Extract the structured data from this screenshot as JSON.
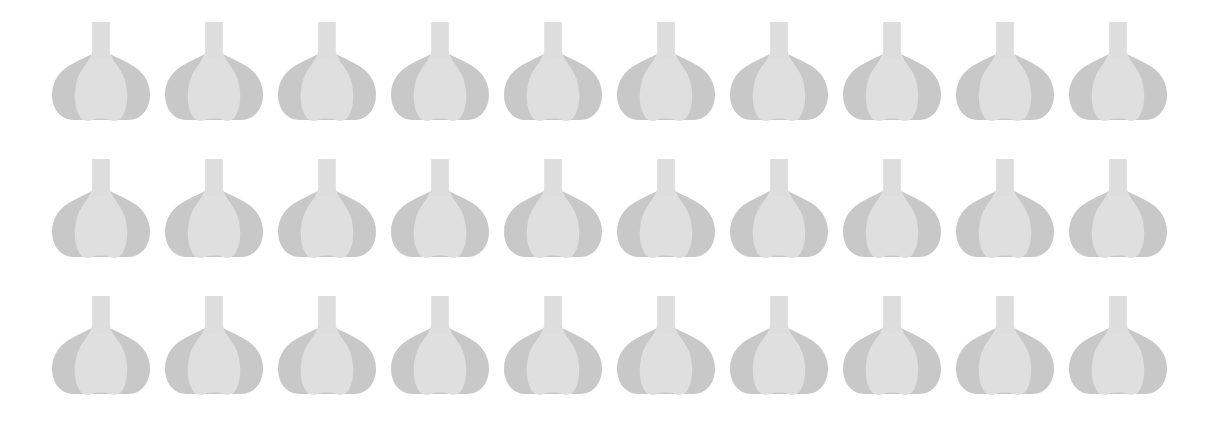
{
  "illustration": {
    "subject": "garlic bulbs",
    "icon": "garlic-icon",
    "rows": 3,
    "columns": 10,
    "count": 30,
    "colors": {
      "background": "#ffffff",
      "outer_lobes": "#c8c8c8",
      "inner_clove": "#dfdfdf",
      "stem": "#dddddd"
    },
    "layout": {
      "origin_x": 52,
      "origin_y": 22,
      "pitch_x": 113,
      "pitch_y": 137
    }
  }
}
